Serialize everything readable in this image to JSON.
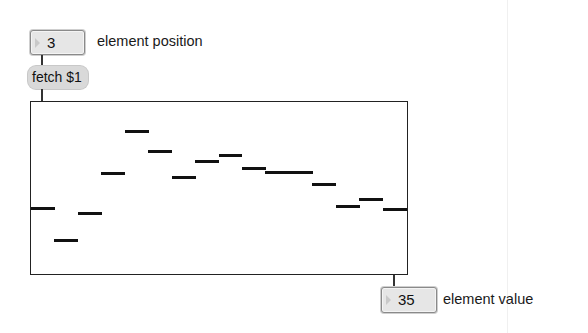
{
  "patch": {
    "position_number_box": {
      "value": "3",
      "label": "element position"
    },
    "fetch_message": {
      "text": "fetch $1"
    },
    "multislider": {
      "range": [
        0,
        100
      ],
      "num_sliders": 16,
      "values": [
        38,
        19,
        35,
        58,
        83,
        71,
        56,
        65,
        69,
        61,
        59,
        59,
        52,
        39,
        43,
        37
      ]
    },
    "value_number_box": {
      "value": "35",
      "label": "element value"
    }
  },
  "colors": {
    "box_fill": "#e6e6e6",
    "message_fill": "#d9d9d9",
    "slider_bar": "#111111",
    "border": "#222222"
  }
}
